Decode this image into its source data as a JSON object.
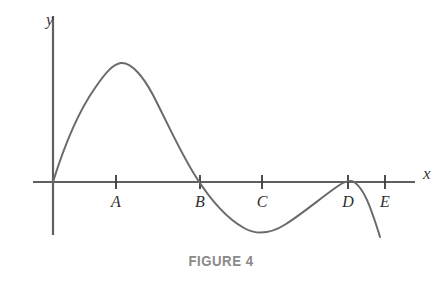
{
  "figure": {
    "caption": "FIGURE 4",
    "axis_labels": {
      "x": "x",
      "y": "y"
    },
    "colors": {
      "curve": "#6a6a6a",
      "axis": "#5f5f5f",
      "tick": "#3a3a3a",
      "label_text": "#2e2e2e",
      "caption_text": "#8a8a8a",
      "background": "#ffffff"
    }
  },
  "chart_data": {
    "type": "line",
    "title": "FIGURE 4",
    "xlabel": "x",
    "ylabel": "y",
    "grid": false,
    "legend": false,
    "axes": {
      "origin_px": [
        53,
        182
      ],
      "x_axis_px": {
        "x1": 33,
        "x2": 415,
        "y": 182
      },
      "y_axis_px": {
        "x": 53,
        "y1": 16,
        "y2": 235
      },
      "x_label_px": [
        425,
        178
      ],
      "y_label_px": [
        52,
        20
      ]
    },
    "tick_labels": [
      "A",
      "B",
      "C",
      "D",
      "E"
    ],
    "ticks_px": [
      116,
      200,
      262,
      348,
      385
    ],
    "tick_label_y_px": 205,
    "annotations": [
      {
        "label": "A",
        "note": "local maximum of curve occurs at A",
        "x_px": 116
      },
      {
        "label": "B",
        "note": "curve crosses x-axis at B",
        "x_px": 200
      },
      {
        "label": "C",
        "note": "local minimum of curve occurs near C",
        "x_px": 262
      },
      {
        "label": "D",
        "note": "curve touches x-axis at D (local maximum)",
        "x_px": 348
      },
      {
        "label": "E",
        "note": "curve crosses below x-axis before E",
        "x_px": 385
      }
    ],
    "curve_points_px": [
      [
        53,
        182
      ],
      [
        60,
        160
      ],
      [
        68,
        139
      ],
      [
        77,
        119
      ],
      [
        87,
        100
      ],
      [
        97,
        84
      ],
      [
        107,
        71
      ],
      [
        116,
        64
      ],
      [
        126,
        63
      ],
      [
        136,
        68
      ],
      [
        146,
        80
      ],
      [
        156,
        97
      ],
      [
        166,
        117
      ],
      [
        176,
        139
      ],
      [
        186,
        160
      ],
      [
        196,
        177
      ],
      [
        206,
        192
      ],
      [
        216,
        205
      ],
      [
        226,
        216
      ],
      [
        236,
        225
      ],
      [
        246,
        230
      ],
      [
        256,
        232
      ],
      [
        266,
        231
      ],
      [
        276,
        228
      ],
      [
        286,
        223
      ],
      [
        296,
        216
      ],
      [
        306,
        208
      ],
      [
        316,
        199
      ],
      [
        326,
        191
      ],
      [
        336,
        185
      ],
      [
        344,
        181
      ],
      [
        350,
        180
      ],
      [
        356,
        182
      ],
      [
        362,
        189
      ],
      [
        368,
        202
      ],
      [
        374,
        218
      ],
      [
        380,
        237
      ]
    ],
    "curve_path": "M53,182 C62,153 76,115 95,88 C106,72 113,64 121,63 C131,62 143,76 153,95 C167,122 180,152 196,177 C210,199 226,218 244,228 C258,236 272,233 286,224 C302,214 322,197 338,186 C344,182 350,179 354,182 C360,186 366,196 371,210 C375,221 378,230 380,237",
    "peak_px": [
      121,
      63
    ],
    "trough_px": [
      262,
      232
    ],
    "local_max_near_d_px": [
      351,
      180
    ],
    "curve_end_px": [
      380,
      237
    ]
  }
}
